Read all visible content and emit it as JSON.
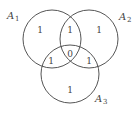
{
  "diagram": {
    "type": "venn",
    "sets": [
      {
        "name": "A",
        "subscript": "1",
        "cx": 52,
        "cy": 39,
        "r": 29
      },
      {
        "name": "A",
        "subscript": "2",
        "cx": 89,
        "cy": 39,
        "r": 29
      },
      {
        "name": "A",
        "subscript": "3",
        "cx": 70,
        "cy": 74,
        "r": 29
      }
    ],
    "regions": {
      "a1_only": "1",
      "a2_only": "1",
      "a3_only": "1",
      "a1_a2": "1",
      "a1_a3": "1",
      "a2_a3": "1",
      "a1_a2_a3": "0"
    },
    "stroke_color": "#555555"
  }
}
